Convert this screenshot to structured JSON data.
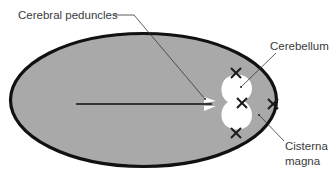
{
  "diagram": {
    "type": "anatomical-schematic",
    "labels": {
      "cerebral_peduncles": "Cerebral peduncles",
      "cerebellum": "Cerebellum",
      "cisterna_magna_line1": "Cisterna",
      "cisterna_magna_line2": "magna"
    },
    "colors": {
      "skull_fill": "#a9a9a9",
      "skull_outline": "#111111",
      "cerebellum_fill": "#ffffff",
      "leader_line": "#333333",
      "cross": "#1a1a1a"
    },
    "markers": [
      "cross-top-cerebellum",
      "cross-mid-cerebellum",
      "cross-cisterna-magna",
      "cross-bottom-cerebellum"
    ]
  }
}
